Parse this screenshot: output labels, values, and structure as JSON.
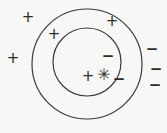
{
  "figure": {
    "width": 167,
    "height": 133,
    "background_color": "#f7f7f5",
    "stroke_color": "#3a3a3a",
    "marker_color": "#2b2b2b",
    "circles": [
      {
        "name": "outer-circle",
        "cx": 87,
        "cy": 64,
        "r": 55,
        "stroke_width": 1.2
      },
      {
        "name": "inner-circle",
        "cx": 87,
        "cy": 62,
        "r": 34,
        "stroke_width": 1.2
      }
    ],
    "markers": [
      {
        "name": "plus-marker-1",
        "glyph": "+",
        "kind": "plus",
        "x": 28,
        "y": 17,
        "region": "outside"
      },
      {
        "name": "plus-marker-2",
        "glyph": "+",
        "kind": "plus",
        "x": 54,
        "y": 34,
        "region": "annulus"
      },
      {
        "name": "plus-marker-3",
        "glyph": "+",
        "kind": "plus",
        "x": 13,
        "y": 58,
        "region": "outside"
      },
      {
        "name": "plus-marker-4",
        "glyph": "+",
        "kind": "plus",
        "x": 112,
        "y": 21,
        "region": "annulus"
      },
      {
        "name": "plus-marker-5",
        "glyph": "+",
        "kind": "plus",
        "x": 88,
        "y": 76,
        "region": "inner"
      },
      {
        "name": "minus-marker-1",
        "glyph": "−",
        "kind": "minus",
        "x": 108,
        "y": 56,
        "region": "inner"
      },
      {
        "name": "minus-marker-2",
        "glyph": "−",
        "kind": "minus",
        "x": 119,
        "y": 79,
        "region": "inner"
      },
      {
        "name": "minus-marker-3",
        "glyph": "−",
        "kind": "minus",
        "x": 152,
        "y": 49,
        "region": "outside"
      },
      {
        "name": "minus-marker-4",
        "glyph": "−",
        "kind": "minus",
        "x": 156,
        "y": 69,
        "region": "outside"
      },
      {
        "name": "minus-marker-5",
        "glyph": "−",
        "kind": "minus",
        "x": 155,
        "y": 85,
        "region": "outside"
      },
      {
        "name": "star-marker-1",
        "glyph": "✳",
        "kind": "star",
        "x": 104,
        "y": 75,
        "region": "inner"
      }
    ]
  }
}
